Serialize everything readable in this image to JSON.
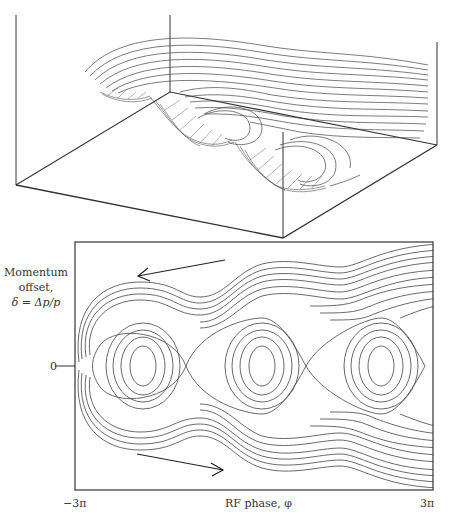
{
  "figure": {
    "top_panel": {
      "description": "3D surface of RF bucket potential with contour lines"
    },
    "bottom_panel": {
      "y_axis_label_lines": [
        "Momentum",
        "offset,",
        "δ = Δp/p"
      ],
      "y_tick_label": "0",
      "x_tick_min": "−3π",
      "x_tick_max": "3π",
      "x_axis_label": "RF phase, φ",
      "islands": 3,
      "arrows": [
        "upper arrow pointing left",
        "lower arrow pointing right"
      ]
    },
    "colors": {
      "line": "#333333",
      "background": "#ffffff"
    }
  }
}
